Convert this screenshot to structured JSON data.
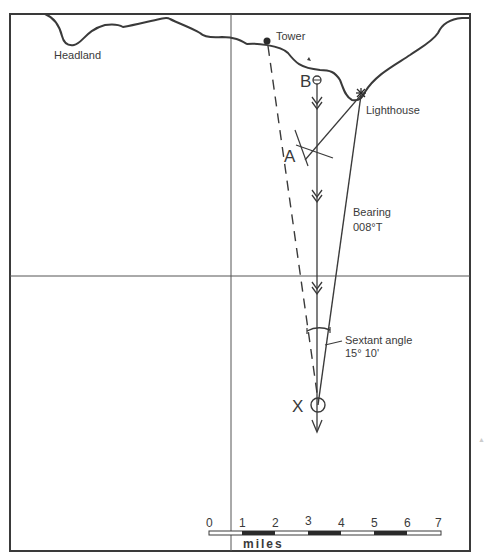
{
  "diagram": {
    "type": "navigation-chart-plot",
    "labels": {
      "headland": "Headland",
      "tower": "Tower",
      "lighthouse": "Lighthouse",
      "point_b": "B",
      "point_a": "A",
      "point_x": "X",
      "bearing_line1": "Bearing",
      "bearing_line2": "008°T",
      "sextant_line1": "Sextant angle",
      "sextant_line2": "15° 10'"
    },
    "scale_bar": {
      "ticks": [
        "0",
        "1",
        "2",
        "3",
        "4",
        "5",
        "6",
        "7"
      ],
      "unit": "miles"
    },
    "colors": {
      "ink": "#3a3a3a",
      "background": "#ffffff"
    }
  }
}
